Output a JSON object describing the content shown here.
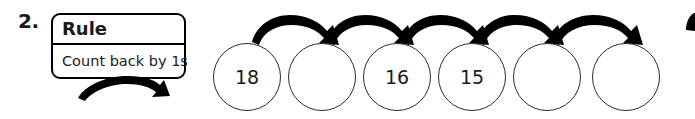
{
  "problem": {
    "number": "2."
  },
  "rule_box": {
    "header_label": "Rule",
    "body_text": "Count back by 1s"
  },
  "sequence": {
    "circles": [
      {
        "value": "18",
        "filled": true
      },
      {
        "value": "",
        "filled": false
      },
      {
        "value": "16",
        "filled": true
      },
      {
        "value": "15",
        "filled": true
      },
      {
        "value": "",
        "filled": false
      },
      {
        "value": "",
        "filled": false
      }
    ],
    "arrow_count": 5,
    "arrow_direction": "right"
  },
  "rule_arrow": {
    "direction": "right",
    "description": "curved arrow from rule box to sequence"
  },
  "colors": {
    "ink": "#1a1a1a",
    "stroke": "#000000",
    "circle_stroke": "#2a2a2a",
    "background": "#ffffff"
  }
}
